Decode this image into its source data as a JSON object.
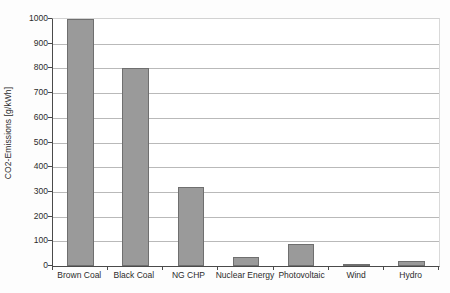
{
  "chart_data": {
    "type": "bar",
    "title": "",
    "subtitle": "",
    "xlabel": "",
    "ylabel": "CO2-Emissions [g/kWh]",
    "categories": [
      "Brown Coal",
      "Black Coal",
      "NG CHP",
      "Nuclear Energy",
      "Photovoltaic",
      "Wind",
      "Hydro"
    ],
    "values": [
      1000,
      800,
      320,
      35,
      90,
      10,
      20
    ],
    "ylim": [
      0,
      1000
    ],
    "ytick_values": [
      0,
      100,
      200,
      300,
      400,
      500,
      600,
      700,
      800,
      900,
      1000
    ],
    "ytick_labels": [
      "0",
      "100",
      "200",
      "300",
      "400",
      "500",
      "600",
      "700",
      "800",
      "900",
      "1000"
    ],
    "grid": "horizontal",
    "legend": "none",
    "annotations": [],
    "colors": {
      "bar_fill": "#9a9a9a",
      "bar_stroke": "#6f6f6f",
      "gridline": "#b9b9b9",
      "axis": "#4a4a4a",
      "text": "#2b2b2b",
      "background": "#ffffff"
    }
  }
}
